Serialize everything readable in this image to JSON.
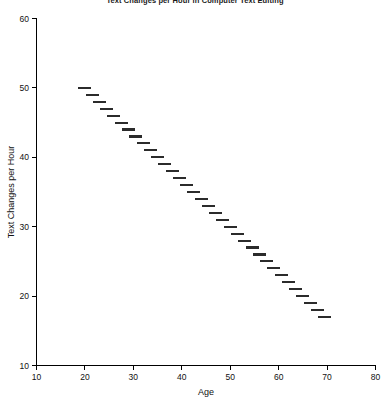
{
  "chart_data": {
    "type": "scatter",
    "title": "Text Changes per Hour in Computer Text Editing",
    "xlabel": "Age",
    "ylabel": "Text Changes per Hour",
    "xlim": [
      10,
      80
    ],
    "ylim": [
      10,
      60
    ],
    "xticks": [
      10,
      20,
      30,
      40,
      50,
      60,
      70,
      80
    ],
    "yticks": [
      10,
      20,
      30,
      40,
      50,
      60
    ],
    "xtick_labels": [
      "10",
      "20",
      "30",
      "40",
      "50",
      "60",
      "70",
      "80"
    ],
    "ytick_labels": [
      "10",
      "20",
      "30",
      "40",
      "50",
      "60"
    ],
    "grid": false,
    "legend": false,
    "marker": "horizontal-dash",
    "series": [
      {
        "name": "Text changes per hour",
        "x": [
          20.0,
          21.5,
          23.0,
          24.5,
          26.0,
          27.5,
          29.0,
          30.5,
          32.0,
          33.5,
          35.0,
          36.5,
          38.0,
          39.5,
          41.0,
          42.5,
          44.0,
          45.5,
          47.0,
          48.5,
          50.0,
          51.5,
          53.0,
          54.5,
          56.0,
          57.5,
          59.0,
          60.5,
          62.0,
          63.5,
          65.0,
          66.5,
          68.0,
          69.5
        ],
        "y": [
          50.0,
          49.0,
          48.0,
          47.0,
          46.0,
          45.0,
          44.0,
          43.0,
          42.0,
          41.0,
          40.0,
          39.0,
          38.0,
          37.0,
          36.0,
          35.0,
          34.0,
          33.0,
          32.0,
          31.0,
          30.0,
          29.0,
          28.0,
          27.0,
          26.0,
          25.0,
          24.0,
          23.0,
          22.0,
          21.0,
          20.0,
          19.0,
          18.0,
          17.0
        ]
      }
    ]
  }
}
